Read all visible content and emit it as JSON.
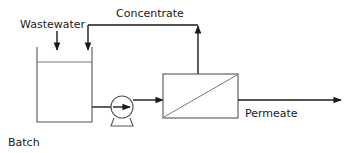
{
  "diagram": {
    "caption": "Batch",
    "background_color": "#ffffff",
    "line_color": "#1a1a1a",
    "vessel_line_color": "#555555",
    "labels": {
      "feed": "Wastewater",
      "recycle": "Concentrate",
      "product": "Permeate"
    },
    "equipment": [
      {
        "id": "feed-tank",
        "name": "feed-tank",
        "type": "open-top-tank",
        "liquid_level_shown": true
      },
      {
        "id": "feed-pump",
        "name": "feed-pump",
        "type": "centrifugal-pump"
      },
      {
        "id": "membrane-module",
        "name": "membrane-module",
        "type": "membrane-module"
      }
    ],
    "streams": [
      {
        "id": "wastewater-feed",
        "label": "Wastewater",
        "from": "inlet",
        "to": "feed-tank",
        "direction": "down"
      },
      {
        "id": "tank-to-pump",
        "label": "",
        "from": "feed-tank",
        "to": "feed-pump",
        "direction": "right"
      },
      {
        "id": "pump-to-module",
        "label": "",
        "from": "feed-pump",
        "to": "membrane-module",
        "direction": "right"
      },
      {
        "id": "concentrate-recycle",
        "label": "Concentrate",
        "from": "membrane-module",
        "to": "feed-tank",
        "direction": "up-left-down"
      },
      {
        "id": "permeate-product",
        "label": "Permeate",
        "from": "membrane-module",
        "to": "outlet",
        "direction": "right"
      }
    ]
  }
}
